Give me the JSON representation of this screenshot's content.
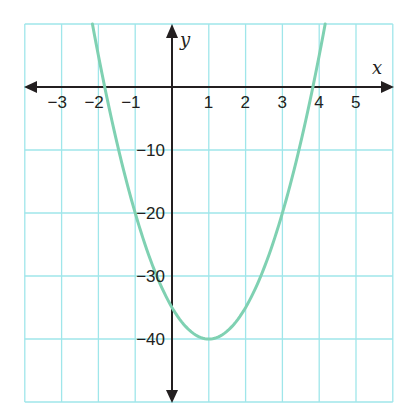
{
  "chart_data": {
    "type": "line",
    "title": "",
    "xlabel": "x",
    "ylabel": "y",
    "xlim": [
      -4,
      6
    ],
    "ylim": [
      -50,
      10
    ],
    "grid": true,
    "x_ticks": [
      -3,
      -2,
      -1,
      1,
      2,
      3,
      4,
      5
    ],
    "x_tick_labels": [
      "−3",
      "−2",
      "−1",
      "1",
      "2",
      "3",
      "4",
      "5"
    ],
    "y_ticks": [
      -10,
      -20,
      -30,
      -40
    ],
    "y_tick_labels": [
      "−10",
      "−20",
      "−30",
      "−40"
    ],
    "x_grid_step": 1,
    "y_grid_step": 10,
    "series": [
      {
        "name": "parabola",
        "equation": "y = 5(x - 1)^2 - 40",
        "vertex": [
          1,
          -40
        ],
        "y_intercept": -35,
        "roots": [
          -1.83,
          3.83
        ],
        "x": [
          -2.16,
          -2,
          -1.83,
          -1,
          0,
          1,
          2,
          3,
          3.83,
          4,
          4.16
        ],
        "values": [
          10,
          5,
          0,
          -20,
          -35,
          -40,
          -35,
          -20,
          0,
          5,
          10
        ]
      }
    ],
    "colors": {
      "curve": "#7fd1b2",
      "grid": "#9fe6ea",
      "axes": "#231f20"
    }
  }
}
